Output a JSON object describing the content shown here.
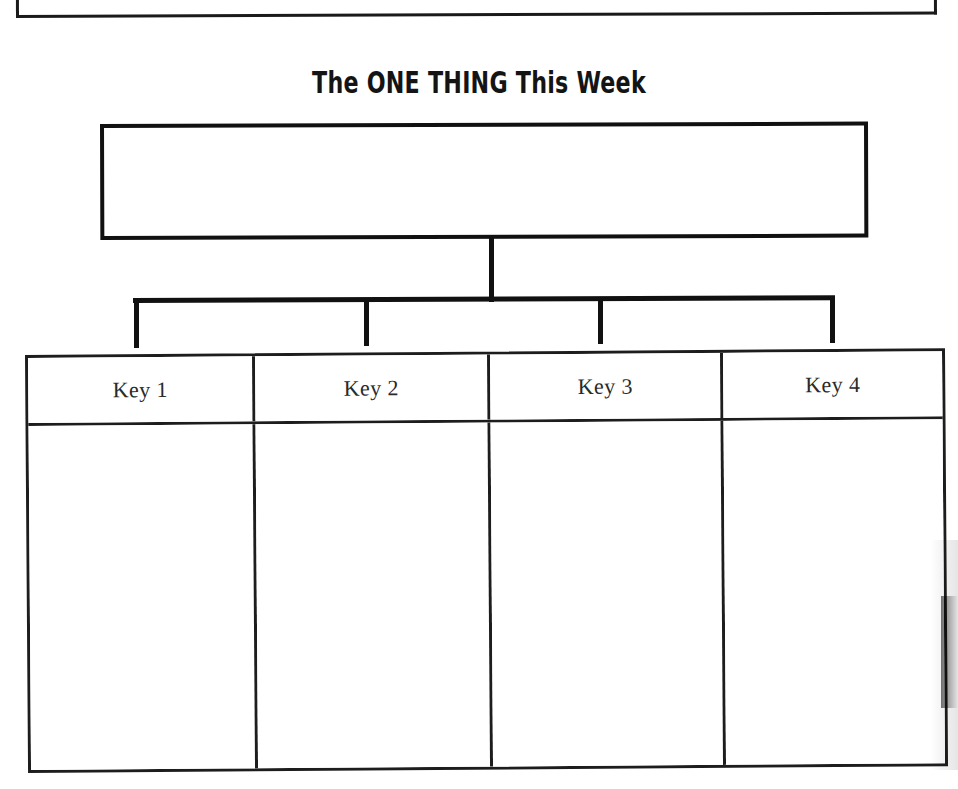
{
  "page": {
    "background_color": "#ffffff",
    "ink_color": "#111111",
    "width": 958,
    "height": 789
  },
  "top_partial_box": {
    "name": "cropped-box-above",
    "content": ""
  },
  "title": {
    "text": "The ONE THING This Week"
  },
  "one_thing_box": {
    "value": "",
    "placeholder": ""
  },
  "connector": {
    "branch_count": 4
  },
  "keys_table": {
    "columns": [
      {
        "header": "Key 1",
        "value": ""
      },
      {
        "header": "Key 2",
        "value": ""
      },
      {
        "header": "Key 3",
        "value": ""
      },
      {
        "header": "Key 4",
        "value": ""
      }
    ]
  }
}
